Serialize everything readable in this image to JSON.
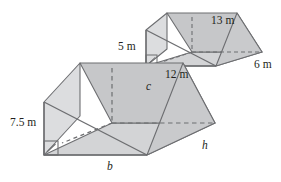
{
  "figure": {
    "name": "two-triangular-prisms-similar-figures",
    "background_color": "#ffffff",
    "stroke_color": "#6d6e71",
    "text_color": "#231f20",
    "face_colors": {
      "top_slanted_face": "#c6c7c9",
      "front_left_face": "#dcdddf",
      "end_triangle_face": "#c9cacc",
      "bottom_face": "#d3d4d6"
    },
    "prisms": [
      {
        "id": "small-prism",
        "name": "small-triangular-prism",
        "labels": [
          {
            "id": "label-5m",
            "text": "5 m",
            "kind": "dimension",
            "edge": "vertical-height"
          },
          {
            "id": "label-13m",
            "text": "13 m",
            "kind": "dimension",
            "edge": "slant-hypotenuse"
          },
          {
            "id": "label-12m",
            "text": "12 m",
            "kind": "dimension",
            "edge": "base"
          },
          {
            "id": "label-6m",
            "text": "6 m",
            "kind": "dimension",
            "edge": "depth"
          }
        ],
        "right_angle_mark": true
      },
      {
        "id": "large-prism",
        "name": "large-triangular-prism",
        "labels": [
          {
            "id": "label-7-5m",
            "text": "7.5 m",
            "kind": "dimension",
            "edge": "vertical-height"
          },
          {
            "id": "label-c",
            "text": "c",
            "kind": "variable",
            "edge": "slant-hypotenuse"
          },
          {
            "id": "label-b",
            "text": "b",
            "kind": "variable",
            "edge": "base"
          },
          {
            "id": "label-h",
            "text": "h",
            "kind": "variable",
            "edge": "depth"
          }
        ],
        "right_angle_mark": true
      }
    ]
  }
}
